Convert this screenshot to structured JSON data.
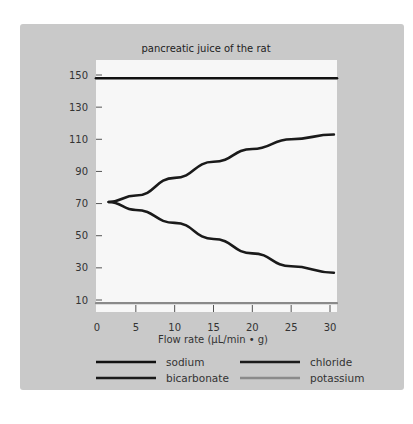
{
  "chart_data": {
    "type": "line",
    "title": "pancreatic juice of the rat",
    "xlabel": "Flow rate (µL/min •  g)",
    "ylabel": "",
    "xlim": [
      0,
      30.5
    ],
    "ylim": [
      0,
      155
    ],
    "x_ticks": [
      0,
      5,
      10,
      15,
      20,
      25,
      30
    ],
    "y_ticks": [
      10,
      30,
      50,
      70,
      90,
      110,
      130,
      150
    ],
    "grid": false,
    "legend_position": "bottom",
    "series": [
      {
        "name": "sodium",
        "color": "#111111",
        "x": [
          0,
          30.5
        ],
        "y": [
          148,
          148
        ]
      },
      {
        "name": "chloride",
        "color": "#1a1a1a",
        "x": [
          1.5,
          5,
          10,
          15,
          20,
          25,
          30.5
        ],
        "y": [
          71,
          75,
          86,
          96,
          104,
          110,
          113
        ]
      },
      {
        "name": "bicarbonate",
        "color": "#1a1a1a",
        "x": [
          1.5,
          5,
          10,
          15,
          20,
          25,
          30.5
        ],
        "y": [
          71,
          66,
          58,
          48,
          39,
          31,
          27
        ]
      },
      {
        "name": "potassium",
        "color": "#8a8a8a",
        "x": [
          0,
          30.5
        ],
        "y": [
          8,
          8
        ]
      }
    ]
  }
}
